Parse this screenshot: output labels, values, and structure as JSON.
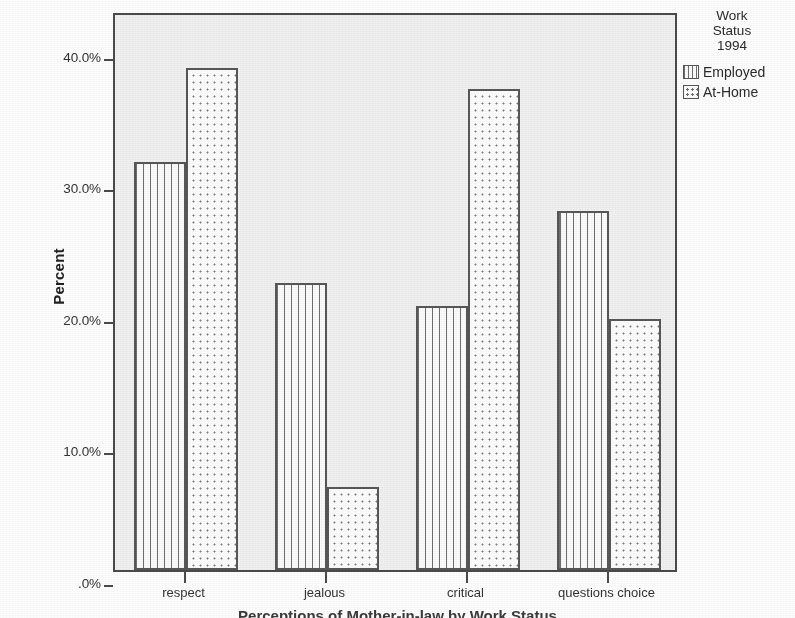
{
  "chart_data": {
    "type": "bar",
    "title": "Perceptions of Mother-in-law by Work Status",
    "xlabel": "",
    "ylabel": "Percent",
    "categories": [
      "respect",
      "jealous",
      "critical",
      "questions choice"
    ],
    "series": [
      {
        "name": "Employed",
        "values": [
          31.0,
          21.8,
          20.1,
          27.3
        ],
        "pattern": "vertical-lines"
      },
      {
        "name": "At-Home",
        "values": [
          38.2,
          6.3,
          36.6,
          19.1
        ],
        "pattern": "dots"
      }
    ],
    "ylim": [
      0,
      42.5
    ],
    "ytick_values": [
      0,
      10,
      20,
      30,
      40
    ],
    "ytick_labels": [
      ".0%",
      "10.0%",
      "20.0%",
      "30.0%",
      "40.0%"
    ],
    "grid": false,
    "legend_position": "right-top",
    "legend_title": "Work\nStatus\n1994"
  },
  "axes": {
    "y_label": "Percent",
    "y_ticks": [
      {
        "label": "40.0%",
        "value": 40
      },
      {
        "label": "30.0%",
        "value": 30
      },
      {
        "label": "20.0%",
        "value": 20
      },
      {
        "label": "10.0%",
        "value": 10
      },
      {
        "label": ".0%",
        "value": 0
      }
    ],
    "x_ticks": [
      {
        "label": "respect"
      },
      {
        "label": "jealous"
      },
      {
        "label": "critical"
      },
      {
        "label": "questions choice"
      }
    ]
  },
  "legend": {
    "title_line1": "Work",
    "title_line2": "Status",
    "title_line3": "1994",
    "items": [
      {
        "label": "Employed",
        "swatch": "vertical-lines-swatch"
      },
      {
        "label": "At-Home",
        "swatch": "dotted-swatch"
      }
    ]
  },
  "footer": {
    "title": "Perceptions of Mother-in-law by Work Status"
  },
  "colors": {
    "plot_background": "#f0f0f0",
    "page_background": "#fdfdfd",
    "axis": "#4a4a4a",
    "bar_outline": "#575757",
    "text": "#2b2b2b"
  }
}
